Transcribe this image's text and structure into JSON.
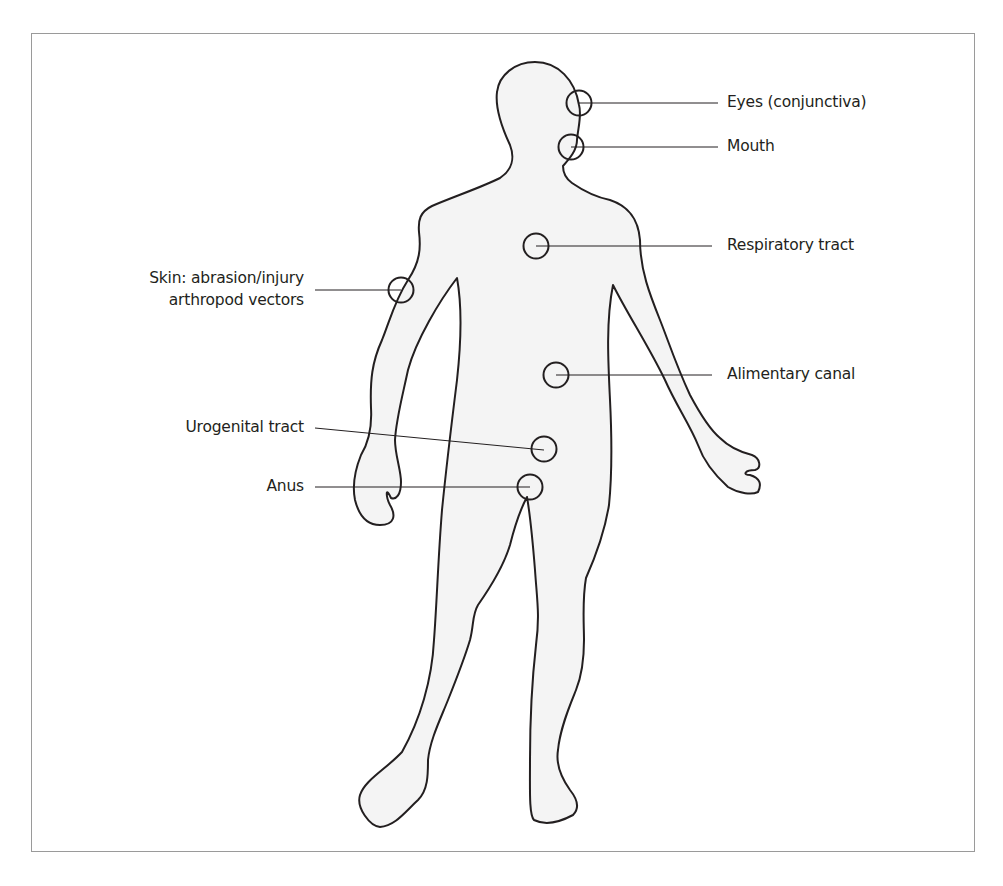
{
  "diagram": {
    "type": "anatomical-entry-points",
    "colors": {
      "outline": "#231f20",
      "body_fill": "#f4f4f4",
      "frame": "#9a9a9a",
      "text": "#231f20"
    },
    "labels": {
      "eyes": "Eyes (conjunctiva)",
      "mouth": "Mouth",
      "respiratory": "Respiratory tract",
      "skin_line1": "Skin: abrasion/injury",
      "skin_line2": "arthropod vectors",
      "alimentary": "Alimentary canal",
      "urogenital": "Urogenital tract",
      "anus": "Anus"
    },
    "entry_points": [
      {
        "id": "eyes",
        "label": "Eyes (conjunctiva)",
        "side": "right",
        "circle": [
          579,
          103
        ]
      },
      {
        "id": "mouth",
        "label": "Mouth",
        "side": "right",
        "circle": [
          571,
          147
        ]
      },
      {
        "id": "respiratory",
        "label": "Respiratory tract",
        "side": "right",
        "circle": [
          536,
          246
        ]
      },
      {
        "id": "skin",
        "label": "Skin: abrasion/injury arthropod vectors",
        "side": "left",
        "circle": [
          401,
          290
        ]
      },
      {
        "id": "alimentary",
        "label": "Alimentary canal",
        "side": "right",
        "circle": [
          556,
          375
        ]
      },
      {
        "id": "urogenital",
        "label": "Urogenital tract",
        "side": "left",
        "circle": [
          544,
          449
        ]
      },
      {
        "id": "anus",
        "label": "Anus",
        "side": "left",
        "circle": [
          530,
          487
        ]
      }
    ]
  }
}
